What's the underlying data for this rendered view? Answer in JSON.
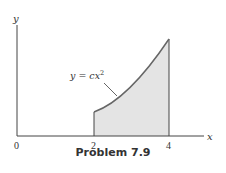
{
  "figure": {
    "caption": "Problem 7.9",
    "function_label": "y = cx",
    "function_exponent": "2",
    "x_axis_label": "x",
    "y_axis_label": "y",
    "x_ticks": [
      "0",
      "2",
      "4"
    ],
    "shaded_region": {
      "from": 2,
      "to": 4,
      "color": "#e4e4e4"
    },
    "curve_color": "#666666"
  }
}
